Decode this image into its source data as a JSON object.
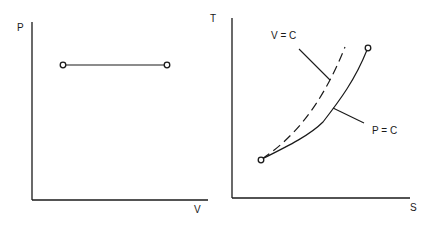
{
  "diagram": {
    "left_panel": {
      "y_axis_label": "P",
      "x_axis_label": "V",
      "process": "constant pressure (horizontal line between two states)",
      "points": [
        {
          "x": 63,
          "y": 65
        },
        {
          "x": 167,
          "y": 65
        }
      ]
    },
    "right_panel": {
      "y_axis_label": "T",
      "x_axis_label": "S",
      "curves": [
        {
          "name": "V = C",
          "style": "dashed",
          "label": "V = C"
        },
        {
          "name": "P = C",
          "style": "solid",
          "label": "P = C"
        }
      ],
      "start_point": {
        "x": 261,
        "y": 160
      },
      "end_point": {
        "x": 368,
        "y": 48
      }
    },
    "colors": {
      "ink": "#1a1a1a",
      "background": "#ffffff"
    }
  }
}
